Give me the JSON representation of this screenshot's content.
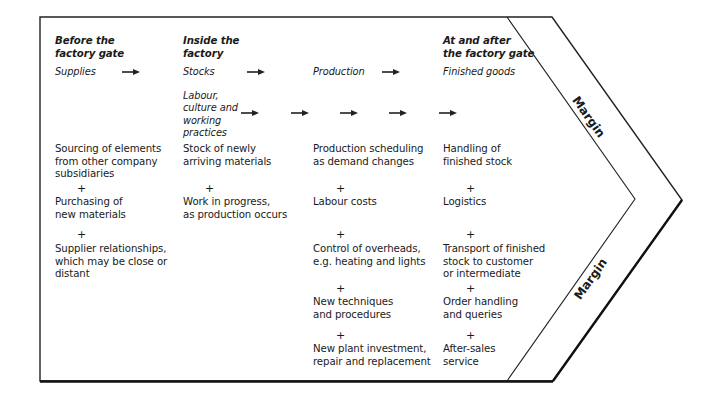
{
  "diagram": {
    "type": "value-chain",
    "columns": [
      {
        "heading": "Before the\nfactory gate",
        "subheading": "Supplies",
        "items": [
          "Sourcing of elements\nfrom other company\nsubsidiaries",
          "Purchasing of\nnew materials",
          "Supplier relationships,\nwhich may be close or\ndistant"
        ]
      },
      {
        "heading": "Inside the\nfactory",
        "subheading": "Stocks",
        "extra_subheading": "Labour,\nculture and\nworking\npractices",
        "items": [
          "Stock of newly\narriving materials",
          "Work in progress,\nas production occurs"
        ]
      },
      {
        "heading": "",
        "subheading": "Production",
        "items": [
          "Production scheduling\nas demand changes",
          "Labour costs",
          "Control of overheads,\ne.g. heating and lights",
          "New techniques\nand procedures",
          "New plant investment,\nrepair and replacement"
        ]
      },
      {
        "heading": "At and after\nthe factory gate",
        "subheading": "Finished goods",
        "items": [
          "Handling of\nfinished stock",
          "Logistics",
          "Transport of finished\nstock to customer\nor intermediate",
          "Order handling\nand queries",
          "After-sales\nservice"
        ]
      }
    ],
    "plus_symbol": "+",
    "margin_labels": [
      "Margin",
      "Margin"
    ]
  }
}
